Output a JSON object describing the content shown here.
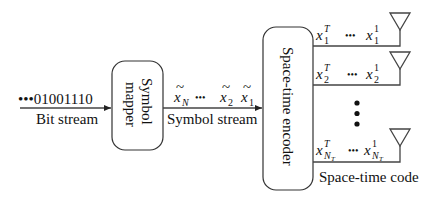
{
  "input": {
    "bits": "•••01001110",
    "label": "Bit stream"
  },
  "mapper": {
    "line1": "Symbol",
    "line2": "mapper"
  },
  "symbols": {
    "xN": "x",
    "xN_sub": "N",
    "dots": "•••",
    "x2": "x",
    "x2_sub": "2",
    "x1": "x",
    "x1_sub": "1",
    "tilde": "~",
    "label": "Symbol stream"
  },
  "encoder": {
    "label": "Space-time encoder"
  },
  "outputs": [
    {
      "first": "x",
      "first_sup": "T",
      "first_sub": "1",
      "dots": "•••",
      "last": "x",
      "last_sup": "1",
      "last_sub": "1"
    },
    {
      "first": "x",
      "first_sup": "T",
      "first_sub": "2",
      "dots": "•••",
      "last": "x",
      "last_sup": "1",
      "last_sub": "2"
    },
    {
      "first": "x",
      "first_sup": "T",
      "first_sub": "N",
      "first_subsub": "T",
      "dots": "•••",
      "last": "x",
      "last_sup": "1",
      "last_sub": "N",
      "last_subsub": "T"
    }
  ],
  "output_label": "Space-time code",
  "icons": {
    "antenna": "antenna-icon",
    "vertical_ellipsis": "vertical-ellipsis-icon"
  }
}
